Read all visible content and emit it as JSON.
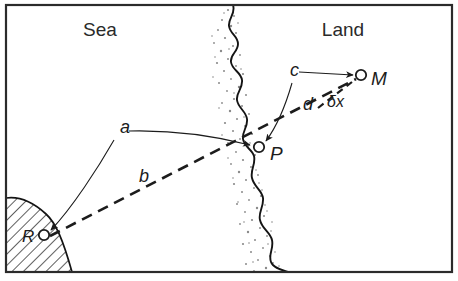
{
  "figure": {
    "border_color": "#2b2b2b",
    "line_color": "#1c1c1c",
    "coast_color": "#141414",
    "stipple_color": "#7d7d7d",
    "hatch_color": "#1a1a1a"
  },
  "regions": [
    {
      "id": "sea",
      "label": "Sea",
      "x": 100,
      "y": 36
    },
    {
      "id": "land",
      "label": "Land",
      "x": 343,
      "y": 36
    }
  ],
  "points": [
    {
      "id": "M",
      "label": "M",
      "marker_x": 361,
      "marker_y": 75,
      "label_x": 371,
      "label_y": 85
    },
    {
      "id": "P",
      "label": "P",
      "marker_x": 259,
      "marker_y": 147,
      "label_x": 270,
      "label_y": 160
    },
    {
      "id": "R",
      "label": "R",
      "marker_x": 44,
      "marker_y": 235,
      "label_x": 22,
      "label_y": 242
    }
  ],
  "path_labels": [
    {
      "id": "a",
      "label": "a",
      "x": 120,
      "y": 133
    },
    {
      "id": "b",
      "label": "b",
      "x": 139,
      "y": 182
    },
    {
      "id": "c",
      "label": "c",
      "x": 290,
      "y": 76
    },
    {
      "id": "d",
      "label": "d",
      "x": 303,
      "y": 110
    },
    {
      "id": "dx",
      "label": "δx",
      "x": 327,
      "y": 107
    }
  ],
  "segments": [
    {
      "id": "a-to-P",
      "style": "solid",
      "from": "a-label",
      "to": "P"
    },
    {
      "id": "a-to-R",
      "style": "solid",
      "from": "a-label",
      "to": "R"
    },
    {
      "id": "b-R-to-M",
      "style": "dashed",
      "from": "R",
      "to": "M"
    },
    {
      "id": "c-to-M",
      "style": "solid",
      "from": "c-label",
      "to": "M"
    },
    {
      "id": "c-to-P",
      "style": "solid",
      "from": "c-label",
      "to": "P"
    }
  ]
}
